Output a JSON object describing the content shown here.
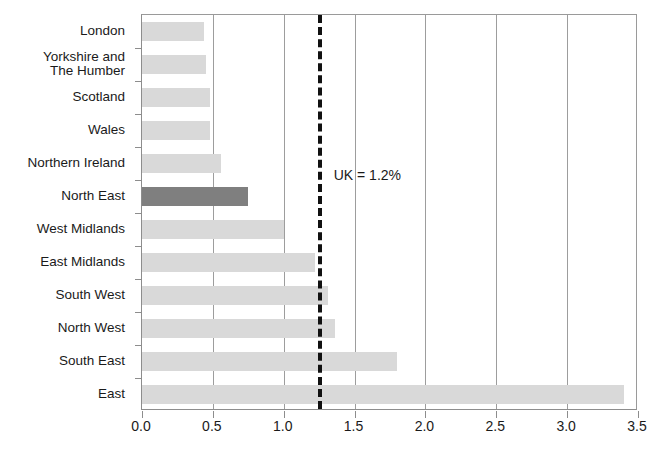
{
  "chart_data": {
    "type": "bar",
    "orientation": "horizontal",
    "title": "",
    "xlabel": "",
    "ylabel": "",
    "xlim": [
      0.0,
      3.5
    ],
    "xticks": [
      "0.0",
      "0.5",
      "1.0",
      "1.5",
      "2.0",
      "2.5",
      "3.0",
      "3.5"
    ],
    "xtick_values": [
      0.0,
      0.5,
      1.0,
      1.5,
      2.0,
      2.5,
      3.0,
      3.5
    ],
    "grid": "vertical",
    "legend": "none",
    "categories": [
      "London",
      "Yorkshire and\nThe Humber",
      "Scotland",
      "Wales",
      "Northern Ireland",
      "North East",
      "West Midlands",
      "East Midlands",
      "South West",
      "North West",
      "South East",
      "East"
    ],
    "values": [
      0.44,
      0.45,
      0.48,
      0.48,
      0.56,
      0.75,
      1.0,
      1.22,
      1.31,
      1.36,
      1.8,
      3.4
    ],
    "highlight_category": "North East",
    "annotations": [
      {
        "text": "UK = 1.2%",
        "value": 1.24,
        "kind": "reference-line-label"
      }
    ],
    "reference_line": {
      "label": "UK = 1.2%",
      "value": 1.24,
      "style": "dashed"
    }
  },
  "colors": {
    "bar": "#d9d9d9",
    "bar_highlight": "#7f7f7f",
    "gridline": "#9d9d9d",
    "axis": "#8d8d8d",
    "reference_line": "#111111",
    "text": "#1a1a1a",
    "background": "#ffffff"
  }
}
